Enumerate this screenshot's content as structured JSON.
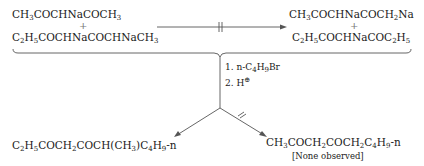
{
  "reactants": {
    "line1": [
      "CH",
      "3",
      "COCHNaCOCH",
      "3"
    ],
    "plus": "+",
    "line2": [
      "C",
      "2",
      "H",
      "5",
      "COCHNaCOCHNaCH",
      "3"
    ]
  },
  "blocked_products": {
    "line1": [
      "CH",
      "3",
      "COCHNaCOCH",
      "2",
      "Na"
    ],
    "plus": "+",
    "line2": [
      "C",
      "2",
      "H",
      "5",
      "COCHNaCOC",
      "2",
      "H",
      "5"
    ]
  },
  "reagents": {
    "step1": [
      "1.  n-C",
      "4",
      "H",
      "9",
      "Br"
    ],
    "step2": [
      "2.  H",
      "⊕"
    ]
  },
  "products": {
    "left": [
      "C",
      "2",
      "H",
      "5",
      "COCH",
      "2",
      "COCH(CH",
      "3",
      ")C",
      "4",
      "H",
      "9",
      "-n"
    ],
    "right": [
      "CH",
      "3",
      "COCH",
      "2",
      "COCH",
      "2",
      "C",
      "4",
      "H",
      "9",
      "-n"
    ],
    "right_note": "[None observed]"
  },
  "colors": {
    "line": "#555555",
    "text": "#1a1a1a"
  }
}
